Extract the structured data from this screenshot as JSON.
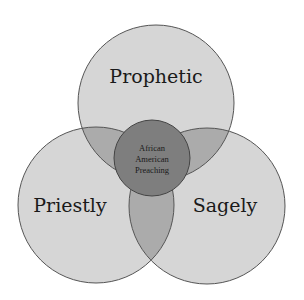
{
  "diagram": {
    "type": "venn",
    "colors": {
      "background": "#ffffff",
      "circle_fill": "#d6d6d6",
      "pair_overlap_fill": "#ababab",
      "center_fill": "#7e7e7e",
      "stroke": "#555555"
    },
    "circles": [
      {
        "id": "prophetic",
        "label": "Prophetic",
        "cx": 156,
        "cy": 103,
        "r": 78
      },
      {
        "id": "priestly",
        "label": "Priestly",
        "cx": 96,
        "cy": 205,
        "r": 78
      },
      {
        "id": "sagely",
        "label": "Sagely",
        "cx": 207,
        "cy": 206,
        "r": 78
      }
    ],
    "center": {
      "cx": 152,
      "cy": 158,
      "r": 38,
      "lines": [
        "African",
        "American",
        "Preaching"
      ]
    }
  }
}
